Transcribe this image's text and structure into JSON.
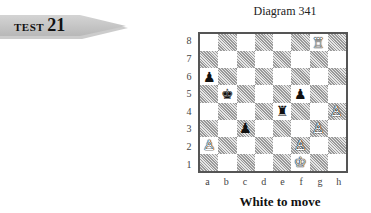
{
  "banner": {
    "word": "TEST",
    "number": "21"
  },
  "diagram": {
    "caption": "Diagram 341",
    "to_move": "White to move",
    "ranks": [
      "8",
      "7",
      "6",
      "5",
      "4",
      "3",
      "2",
      "1"
    ],
    "files": [
      "a",
      "b",
      "c",
      "d",
      "e",
      "f",
      "g",
      "h"
    ],
    "squares": [
      [
        "",
        "",
        "",
        "",
        "",
        "",
        "♖",
        ""
      ],
      [
        "",
        "",
        "",
        "",
        "",
        "",
        "",
        ""
      ],
      [
        "♟",
        "",
        "",
        "",
        "",
        "",
        "",
        ""
      ],
      [
        "",
        "♚",
        "",
        "",
        "",
        "♟",
        "",
        ""
      ],
      [
        "",
        "",
        "",
        "",
        "♜",
        "",
        "",
        "♙"
      ],
      [
        "",
        "",
        "♟",
        "",
        "",
        "",
        "♙",
        ""
      ],
      [
        "♙",
        "",
        "",
        "",
        "",
        "♙",
        "",
        ""
      ],
      [
        "",
        "",
        "",
        "",
        "",
        "♔",
        "",
        ""
      ]
    ],
    "colors": [
      [
        "",
        "",
        "",
        "",
        "",
        "",
        "w",
        ""
      ],
      [
        "",
        "",
        "",
        "",
        "",
        "",
        "",
        ""
      ],
      [
        "b",
        "",
        "",
        "",
        "",
        "",
        "",
        ""
      ],
      [
        "",
        "b",
        "",
        "",
        "",
        "b",
        "",
        ""
      ],
      [
        "",
        "",
        "",
        "",
        "b",
        "",
        "",
        "w"
      ],
      [
        "",
        "",
        "b",
        "",
        "",
        "",
        "w",
        ""
      ],
      [
        "w",
        "",
        "",
        "",
        "",
        "w",
        "",
        ""
      ],
      [
        "",
        "",
        "",
        "",
        "",
        "w",
        "",
        ""
      ]
    ]
  }
}
